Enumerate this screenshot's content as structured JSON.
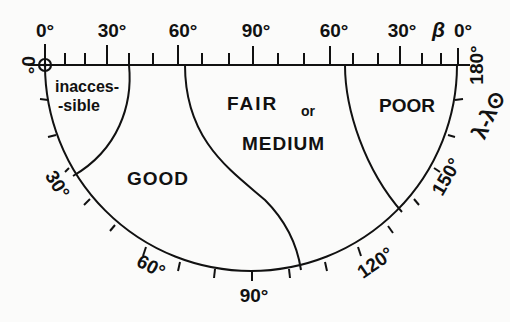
{
  "diagram": {
    "type": "polar-semicircle-chart",
    "top_axis": {
      "symbol": "β",
      "tick_labels": [
        "0°",
        "30°",
        "60°",
        "90°",
        "60°",
        "30°",
        "0°"
      ]
    },
    "arc_axis": {
      "symbol": "λ-λ⊙",
      "tick_labels": [
        "0°",
        "30°",
        "60°",
        "90°",
        "120°",
        "150°",
        "180°"
      ]
    },
    "regions": [
      {
        "name": "inaccessible",
        "label_line1": "inacces-",
        "label_line2": "-sible"
      },
      {
        "name": "good",
        "label": "GOOD"
      },
      {
        "name": "fair",
        "label_line1": "FAIR",
        "label_or": "or",
        "label_line2": "MEDIUM"
      },
      {
        "name": "poor",
        "label": "POOR"
      }
    ],
    "sun_marker": "⊙",
    "colors": {
      "ink": "#111111",
      "background": "#fbfbfa"
    }
  }
}
